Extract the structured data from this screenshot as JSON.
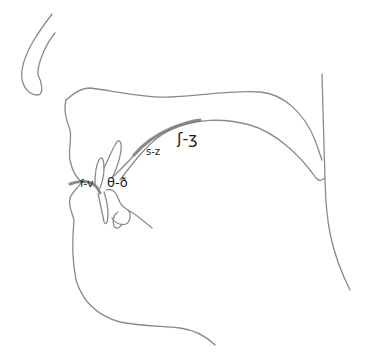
{
  "diagram": {
    "type": "sagittal section of vocal tract",
    "labels": {
      "labiodental": "f-v",
      "dental": "θ-ð",
      "alveolar": "s-z",
      "postalveolar": "ʃ-ʒ"
    },
    "colors": {
      "outline": "#8a8a8a",
      "shading": "#777777",
      "text": "#222222",
      "background": "#ffffff"
    }
  }
}
